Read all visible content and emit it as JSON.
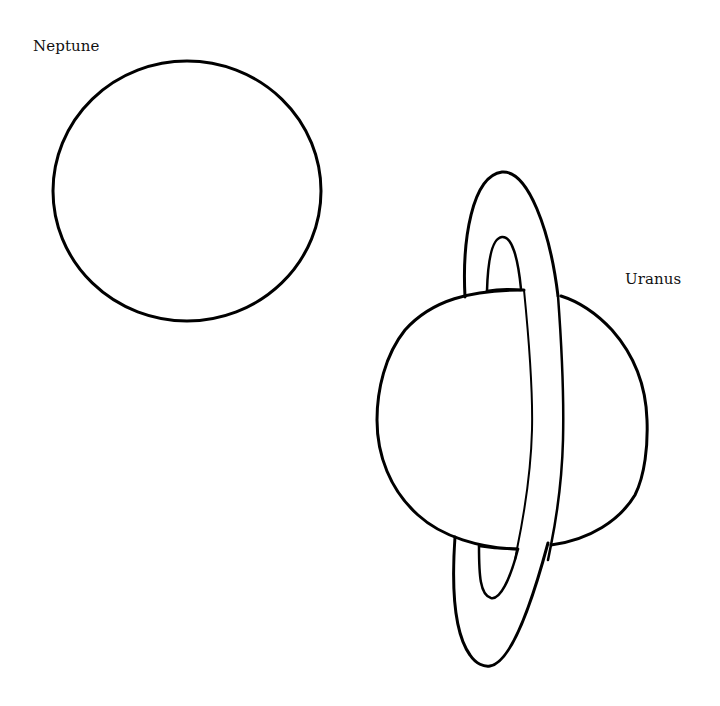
{
  "page": {
    "type": "coloring-page",
    "background": "#ffffff",
    "line_color": "#000000"
  },
  "labels": {
    "neptune": "Neptune",
    "uranus": "Uranus"
  },
  "figures": {
    "neptune": {
      "shape": "circle",
      "cx": 187,
      "cy": 191,
      "rx": 134,
      "ry": 130
    },
    "uranus": {
      "planet": {
        "shape": "circle",
        "cx": 512,
        "cy": 419,
        "rx": 135,
        "ry": 129
      },
      "ring": {
        "orientation": "near-vertical",
        "outer_top_y": 172,
        "outer_bottom_y": 667,
        "inner_top_y": 237,
        "inner_bottom_y": 598
      }
    }
  }
}
